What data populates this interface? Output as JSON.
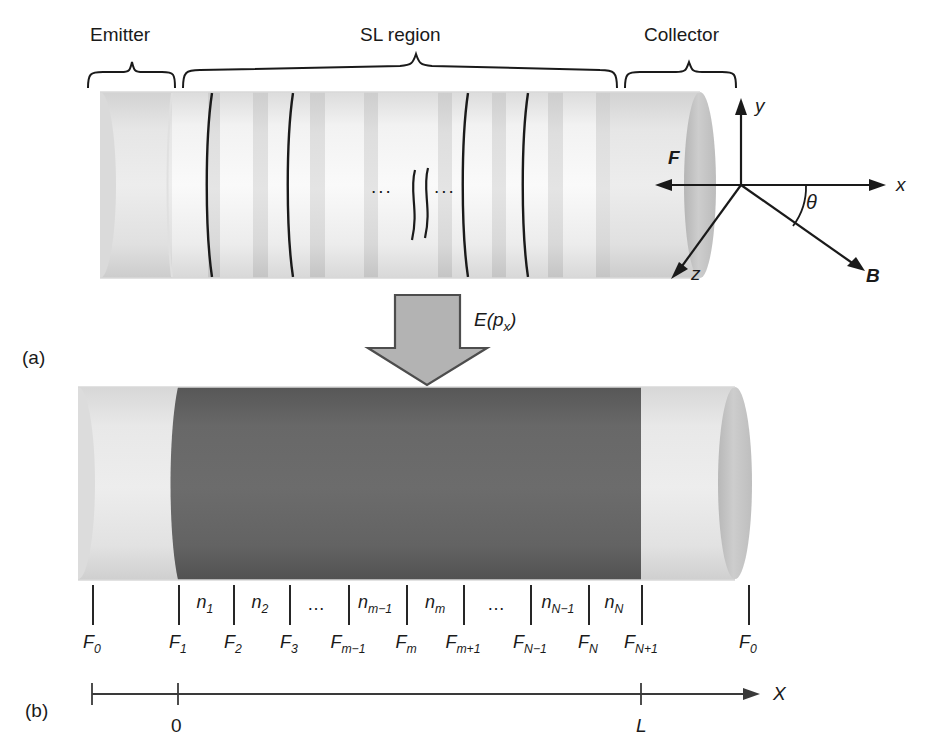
{
  "figure": {
    "background": "#ffffff"
  },
  "panels": [
    {
      "tag": "(a)",
      "name": "panel-a-tag"
    },
    {
      "tag": "(b)",
      "name": "panel-b-tag"
    }
  ],
  "panel_a": {
    "region_labels": [
      {
        "id": "emitter",
        "text": "Emitter"
      },
      {
        "id": "sl-region",
        "text": "SL region"
      },
      {
        "id": "collector",
        "text": "Collector"
      }
    ],
    "break_dots_left": "...",
    "break_dots_right": "...",
    "axes": [
      {
        "id": "y-axis",
        "label": "y",
        "style": "italic"
      },
      {
        "id": "x-axis",
        "label": "x",
        "style": "italic"
      },
      {
        "id": "z-axis",
        "label": "z",
        "style": "italic"
      },
      {
        "id": "force-vector",
        "label": "F",
        "style": "bold-italic"
      },
      {
        "id": "magnetic-field-vector",
        "label": "B",
        "style": "bold-italic"
      },
      {
        "id": "angle",
        "label": "θ",
        "style": "italic"
      }
    ],
    "colors": {
      "emitter_fill": "#e9e9e9",
      "well_fill": "#f5f5f5",
      "band_fill": "#dcdcdc",
      "barrier_line": "#1a1a1a",
      "collector_fill": "#e4e4e4",
      "cap_fill": "#c9c9c9",
      "outline": "#cfcfcf"
    }
  },
  "transition": {
    "arrow_label": "E(p",
    "arrow_label_sub": "x",
    "arrow_label_close": ")",
    "arrow_fill": "#b3b3b3",
    "arrow_stroke": "#4d4d4d"
  },
  "panel_b": {
    "colors": {
      "light_fill": "#e4e4e4",
      "dark_fill": "#636363",
      "cap_fill": "#c9c9c9",
      "outline": "#d5d5d5"
    },
    "well_labels": [
      {
        "id": "n1",
        "base": "n",
        "sub": "1",
        "x": 205
      },
      {
        "id": "n2",
        "base": "n",
        "sub": "2",
        "x": 260
      },
      {
        "id": "dots-left",
        "base": "…",
        "sub": "",
        "x": 317
      },
      {
        "id": "nm-1",
        "base": "n",
        "sub": "m−1",
        "x": 375
      },
      {
        "id": "nm",
        "base": "n",
        "sub": "m",
        "x": 435
      },
      {
        "id": "dots-right",
        "base": "…",
        "sub": "",
        "x": 497
      },
      {
        "id": "nN-1",
        "base": "n",
        "sub": "N−1",
        "x": 558
      },
      {
        "id": "nN",
        "base": "n",
        "sub": "N",
        "x": 614
      }
    ],
    "field_labels": [
      {
        "id": "F0-left",
        "base": "F",
        "sub": "0",
        "x": 92
      },
      {
        "id": "F1",
        "base": "F",
        "sub": "1",
        "x": 178
      },
      {
        "id": "F2",
        "base": "F",
        "sub": "2",
        "x": 233
      },
      {
        "id": "F3",
        "base": "F",
        "sub": "3",
        "x": 289
      },
      {
        "id": "Fm-1",
        "base": "F",
        "sub": "m−1",
        "x": 348
      },
      {
        "id": "Fm",
        "base": "F",
        "sub": "m",
        "x": 406
      },
      {
        "id": "Fm+1",
        "base": "F",
        "sub": "m+1",
        "x": 463
      },
      {
        "id": "FN-1",
        "base": "F",
        "sub": "N−1",
        "x": 530
      },
      {
        "id": "FN",
        "base": "F",
        "sub": "N",
        "x": 588
      },
      {
        "id": "FN+1",
        "base": "F",
        "sub": "N+1",
        "x": 641
      },
      {
        "id": "F0-right",
        "base": "F",
        "sub": "0",
        "x": 748
      }
    ],
    "ticks_x": [
      92,
      178,
      233,
      289,
      348,
      406,
      463,
      530,
      588,
      641,
      748
    ],
    "axis": {
      "label": "X",
      "ticks": [
        {
          "id": "origin",
          "label": "0",
          "x": 178
        },
        {
          "id": "length",
          "label": "L",
          "x": 641
        }
      ],
      "start_x": 92,
      "end_x": 752,
      "y": 694
    }
  }
}
